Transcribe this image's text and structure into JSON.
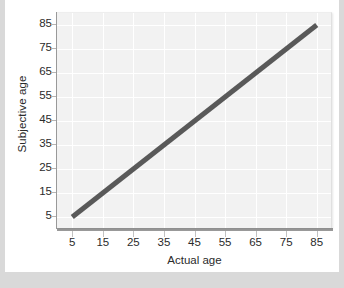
{
  "chart_data": {
    "type": "line",
    "title": "",
    "xlabel": "Actual age",
    "ylabel": "Subjective age",
    "xlim": [
      0,
      90
    ],
    "ylim": [
      0,
      90
    ],
    "xticks": [
      5,
      15,
      25,
      35,
      45,
      55,
      65,
      75,
      85
    ],
    "xtick_labels": [
      "5",
      "15",
      "25",
      "35",
      "45",
      "55",
      "65",
      "75",
      "85"
    ],
    "yticks": [
      5,
      15,
      25,
      35,
      45,
      55,
      65,
      75,
      85
    ],
    "ytick_labels": [
      "5",
      "15",
      "25",
      "35",
      "45",
      "55",
      "65",
      "75",
      "85"
    ],
    "grid": true,
    "legend": "none",
    "series": [
      {
        "name": "Subjective age vs actual age",
        "x": [
          5,
          15,
          25,
          35,
          45,
          55,
          65,
          75,
          85
        ],
        "values": [
          5,
          15,
          25,
          35,
          45,
          55,
          65,
          75,
          85
        ],
        "color": "#595959",
        "line_width": 5
      }
    ],
    "annotations": []
  },
  "colors": {
    "page_background": "#d9d9d9",
    "card_background": "#ffffff",
    "plot_background": "#f2f2f2",
    "gridline": "#ffffff",
    "axis_line": "#9a9a9a",
    "data_line": "#595959",
    "tick_text": "#2b2b2b"
  }
}
